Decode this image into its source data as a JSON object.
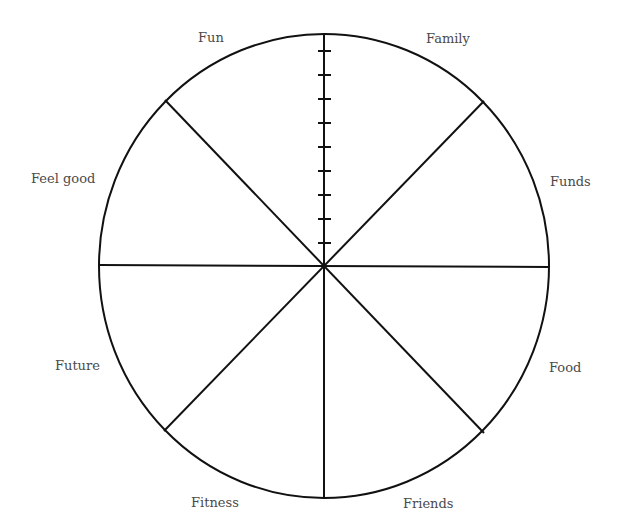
{
  "diagram": {
    "type": "wheel-of-life",
    "segments": 8,
    "scale_ticks": 9,
    "line_color": "#111111",
    "label_color": "#4a4a4a",
    "labels": {
      "top_left": "Fun",
      "top_right": "Family",
      "upper_right": "Funds",
      "lower_right": "Food",
      "bottom_right": "Friends",
      "bottom_left": "Fitness",
      "lower_left": "Future",
      "upper_left": "Feel good"
    }
  }
}
